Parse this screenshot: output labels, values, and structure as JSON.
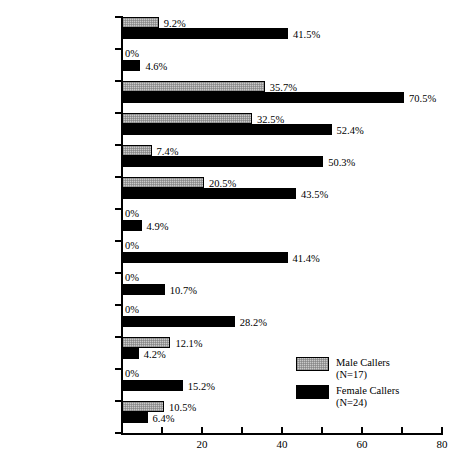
{
  "chart_data": {
    "type": "bar",
    "orientation": "horizontal",
    "title": "",
    "xlabel": "",
    "ylabel": "",
    "xlim": [
      0,
      80
    ],
    "xticks": [
      0,
      10,
      20,
      30,
      40,
      50,
      60,
      70,
      80
    ],
    "xtick_labels": [
      "",
      "",
      "20",
      "",
      "40",
      "",
      "60",
      "",
      "80"
    ],
    "grid": false,
    "legend_position": "bottom-right",
    "value_suffix": "%",
    "categories": [
      "Broke up fight",
      "Hit or pushed",
      "Tried to calm\neveryone",
      "Took time to listen\nto story",
      "Warned",
      "Took information/\nfiled report",
      "Ordered caller out\nof home",
      "Ordered caller's\nspouse out of home",
      "Threatened arrest\nnow",
      "Threatened arrest\nnext time",
      "Arrested caller",
      "Arrested caller's\nspouse",
      "Police did nothing"
    ],
    "series": [
      {
        "name": "Male Callers",
        "legend_label": "Male Callers",
        "legend_sublabel": "(N=17)",
        "color": "#c9c9c9",
        "values": [
          9.2,
          0,
          35.7,
          32.5,
          7.4,
          20.5,
          0,
          0,
          0,
          0,
          12.1,
          0,
          10.5
        ],
        "value_labels": [
          "9.2%",
          "0%",
          "35.7%",
          "32.5%",
          "7.4%",
          "20.5%",
          "0%",
          "0%",
          "0%",
          "0%",
          "12.1%",
          "0%",
          "10.5%"
        ]
      },
      {
        "name": "Female Callers",
        "legend_label": "Female Callers",
        "legend_sublabel": "(N=24)",
        "color": "#000000",
        "values": [
          41.5,
          4.6,
          70.5,
          52.4,
          50.3,
          43.5,
          4.9,
          41.4,
          10.7,
          28.2,
          4.2,
          15.2,
          6.4
        ],
        "value_labels": [
          "41.5%",
          "4.6%",
          "70.5%",
          "52.4%",
          "50.3%",
          "43.5%",
          "4.9%",
          "41.4%",
          "10.7%",
          "28.2%",
          "4.2%",
          "15.2%",
          "6.4%"
        ]
      }
    ]
  }
}
